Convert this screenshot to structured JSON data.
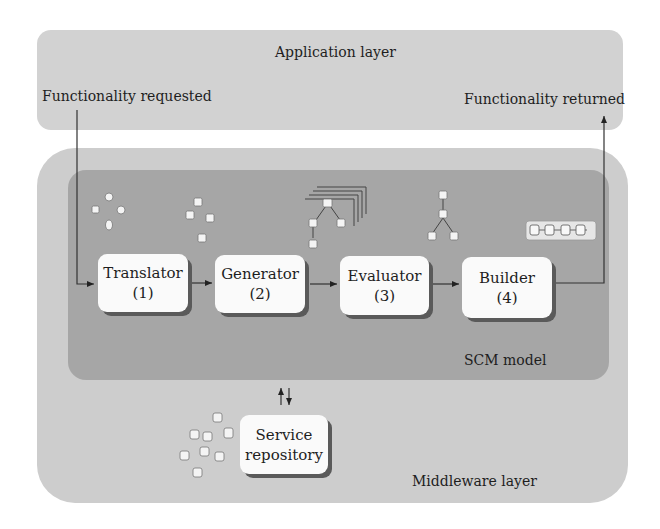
{
  "application_layer": {
    "title": "Application layer",
    "input_label": "Functionality requested",
    "output_label": "Functionality returned"
  },
  "middleware_layer": {
    "title": "Middleware layer",
    "repository": {
      "line1": "Service",
      "line2": "repository"
    }
  },
  "scm_model": {
    "title": "SCM model",
    "stages": [
      {
        "name": "Translator",
        "index": "(1)",
        "icon": "scattered-nodes-icon"
      },
      {
        "name": "Generator",
        "index": "(2)",
        "icon": "service-set-icon"
      },
      {
        "name": "Evaluator",
        "index": "(3)",
        "icon": "stacked-trees-icon"
      },
      {
        "name": "Builder",
        "index": "(4)",
        "icon": "tree-icon"
      }
    ],
    "output_icon": "service-chain-icon"
  },
  "colors": {
    "application_layer_bg": "#d2d2d2",
    "middleware_layer_bg": "#cdcdcd",
    "scm_model_bg": "#a6a6a6",
    "box_bg": "#fafafa",
    "line": "#333333"
  }
}
